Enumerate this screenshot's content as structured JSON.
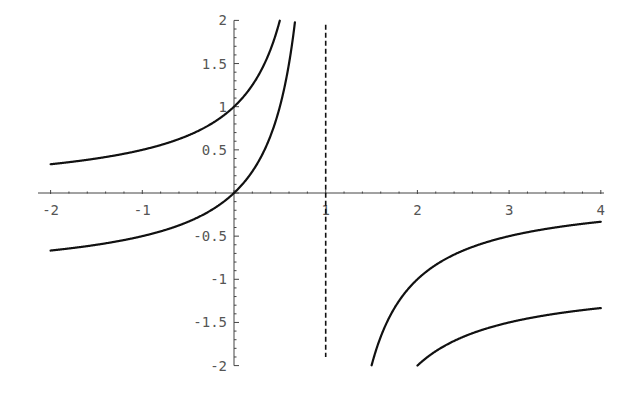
{
  "chart_data": {
    "type": "line",
    "title": "",
    "xlabel": "",
    "ylabel": "",
    "xlim": [
      -2,
      4
    ],
    "ylim": [
      -2,
      2
    ],
    "grid": false,
    "legend": null,
    "x_ticks": [
      {
        "value": -2,
        "label": "-2"
      },
      {
        "value": -1,
        "label": "-1"
      },
      {
        "value": 1,
        "label": "1"
      },
      {
        "value": 2,
        "label": "2"
      },
      {
        "value": 3,
        "label": "3"
      },
      {
        "value": 4,
        "label": "4"
      }
    ],
    "y_ticks": [
      {
        "value": 2,
        "label": "2"
      },
      {
        "value": 1.5,
        "label": "1.5"
      },
      {
        "value": 1,
        "label": "1"
      },
      {
        "value": 0.5,
        "label": "0.5"
      },
      {
        "value": -0.5,
        "label": "-0.5"
      },
      {
        "value": -1,
        "label": "-1"
      },
      {
        "value": -1.5,
        "label": "-1.5"
      },
      {
        "value": -2,
        "label": "-2"
      }
    ],
    "series": [
      {
        "name": "curve-a",
        "function": "1/(1-x)",
        "x": [
          -2,
          -1.5,
          -1,
          -0.5,
          0,
          0.25,
          0.5,
          1.5,
          2,
          2.5,
          3,
          3.5,
          4
        ],
        "y": [
          0.333,
          0.4,
          0.5,
          0.667,
          1,
          1.333,
          2,
          -2,
          -1,
          -0.667,
          -0.5,
          -0.4,
          -0.333
        ]
      },
      {
        "name": "curve-b",
        "function": "x/(1-x)",
        "x": [
          -2,
          -1.5,
          -1,
          -0.5,
          0,
          0.25,
          0.5,
          0.667,
          2,
          2.5,
          3,
          3.5,
          4
        ],
        "y": [
          -0.667,
          -0.6,
          -0.5,
          -0.333,
          0,
          0.333,
          1,
          2,
          -2,
          -1.667,
          -1.5,
          -1.4,
          -1.333
        ]
      }
    ],
    "annotations": [
      {
        "type": "vertical-asymptote",
        "x": 1,
        "style": "dashed",
        "y_from": -1.9,
        "y_to": 1.95
      }
    ]
  },
  "colors": {
    "curve": "#111111",
    "axis": "#444444",
    "tick_label": "#555555",
    "background": "#ffffff"
  }
}
